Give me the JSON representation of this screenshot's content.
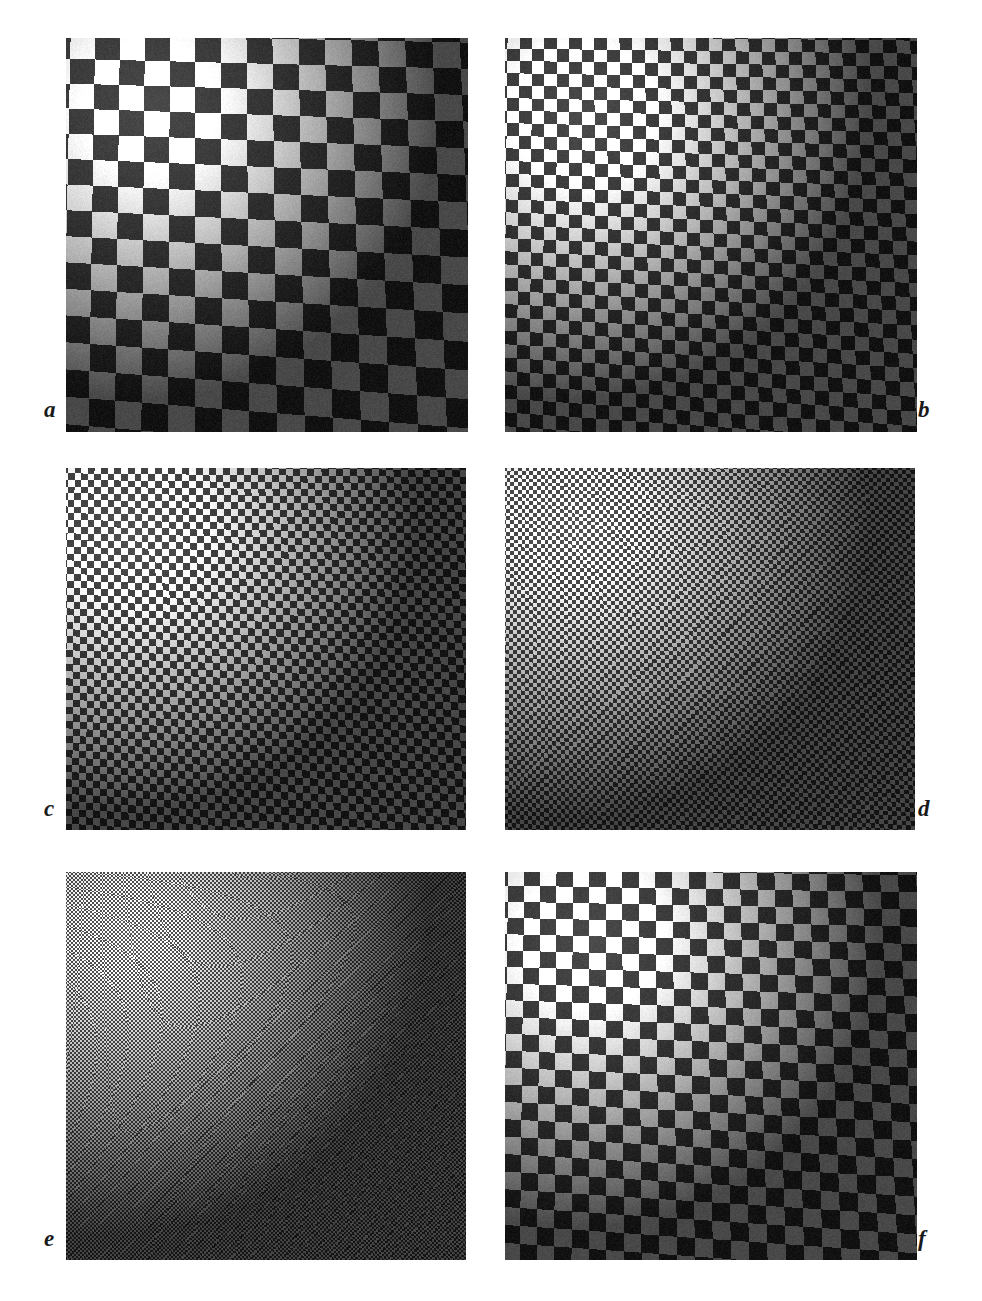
{
  "figure": {
    "background_color": "#ffffff",
    "label_color": "#1a1a1a",
    "panel_count": 6,
    "columns": 2,
    "rows": 3
  },
  "chart_data": {
    "type": "heatmap",
    "title": "",
    "subtitle": "",
    "xlabel": "",
    "ylabel": "",
    "grid": false,
    "legend_position": "none",
    "panels": [
      {
        "label": "a",
        "label_position": "bottom-left",
        "x": 66,
        "y": 38,
        "width": 402,
        "height": 394,
        "check_px": 26,
        "light_gray": "#f2f2f2",
        "dark_gray": "#3a3a3a",
        "illumination": {
          "type": "radial-gradient",
          "center_x_pct": 22,
          "center_y_pct": 18,
          "peak": 1.32,
          "falloff": 0.34
        },
        "rotation_deg": -1.2,
        "noise": 0.055
      },
      {
        "label": "b",
        "label_position": "bottom-right",
        "x": 505,
        "y": 38,
        "width": 412,
        "height": 394,
        "check_px": 13,
        "light_gray": "#f2f2f2",
        "dark_gray": "#3a3a3a",
        "illumination": {
          "type": "radial-gradient",
          "center_x_pct": 20,
          "center_y_pct": 20,
          "peak": 1.34,
          "falloff": 0.32
        },
        "rotation_deg": -0.6,
        "noise": 0.05
      },
      {
        "label": "c",
        "label_position": "bottom-left",
        "x": 66,
        "y": 468,
        "width": 400,
        "height": 362,
        "check_px": 7,
        "light_gray": "#efefef",
        "dark_gray": "#3d3d3d",
        "illumination": {
          "type": "radial-gradient",
          "center_x_pct": 18,
          "center_y_pct": 18,
          "peak": 1.35,
          "falloff": 0.33
        },
        "rotation_deg": -0.5,
        "noise": 0.05
      },
      {
        "label": "d",
        "label_position": "bottom-right",
        "x": 505,
        "y": 468,
        "width": 410,
        "height": 362,
        "check_px": 4,
        "light_gray": "#ececec",
        "dark_gray": "#424242",
        "illumination": {
          "type": "radial-gradient",
          "center_x_pct": 18,
          "center_y_pct": 16,
          "peak": 1.3,
          "falloff": 0.36
        },
        "rotation_deg": -0.4,
        "noise": 0.045
      },
      {
        "label": "e",
        "label_position": "bottom-left",
        "x": 66,
        "y": 872,
        "width": 400,
        "height": 388,
        "check_px": 2,
        "light_gray": "#e6e6e6",
        "dark_gray": "#484848",
        "illumination": {
          "type": "radial-gradient",
          "center_x_pct": 16,
          "center_y_pct": 16,
          "peak": 1.26,
          "falloff": 0.38
        },
        "rotation_deg": -0.3,
        "noise": 0.04
      },
      {
        "label": "f",
        "label_position": "bottom-right",
        "x": 505,
        "y": 872,
        "width": 412,
        "height": 388,
        "check_px": 17,
        "light_gray": "#f2f2f2",
        "dark_gray": "#3a3a3a",
        "illumination": {
          "type": "radial-gradient",
          "center_x_pct": 22,
          "center_y_pct": 18,
          "peak": 1.33,
          "falloff": 0.33
        },
        "rotation_deg": -0.8,
        "noise": 0.055
      }
    ]
  },
  "labels": {
    "a": "a",
    "b": "b",
    "c": "c",
    "d": "d",
    "e": "e",
    "f": "f"
  },
  "label_positions": {
    "a": {
      "x": 44,
      "y": 398
    },
    "b": {
      "x": 918,
      "y": 398
    },
    "c": {
      "x": 44,
      "y": 797
    },
    "d": {
      "x": 918,
      "y": 797
    },
    "e": {
      "x": 44,
      "y": 1227
    },
    "f": {
      "x": 918,
      "y": 1227
    }
  }
}
